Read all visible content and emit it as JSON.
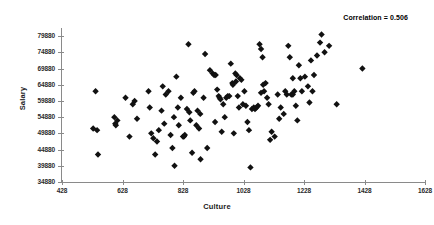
{
  "chart_data": {
    "type": "scatter",
    "title": "",
    "xlabel": "Culture",
    "ylabel": "Salary",
    "xlim": [
      428,
      1628
    ],
    "ylim": [
      34880,
      82380
    ],
    "xticks": [
      428,
      628,
      828,
      1028,
      1228,
      1428,
      1628
    ],
    "yticks": [
      34880,
      39880,
      44880,
      49880,
      54880,
      59880,
      64880,
      69880,
      74880,
      79880
    ],
    "xtick_labels": [
      "428",
      "628",
      "828",
      "1028",
      "1228",
      "1428",
      "1628"
    ],
    "ytick_labels": [
      "34880",
      "39880",
      "44880",
      "49880",
      "54880",
      "59880",
      "64880",
      "69880",
      "74880",
      "79880"
    ],
    "grid": false,
    "legend": false,
    "marker": "diamond",
    "marker_color": "#111111",
    "marker_size": 3.2,
    "axis_color": "#8a8a8a",
    "background_color": "#ffffff",
    "annotations": [
      {
        "name": "correlation",
        "text": "Correlation = 0.506",
        "value": 0.506,
        "position": "top-right"
      }
    ],
    "series": [
      {
        "name": "Culture vs Salary",
        "points": [
          [
            531,
            51380
          ],
          [
            539,
            62880
          ],
          [
            544,
            50880
          ],
          [
            547,
            43380
          ],
          [
            601,
            54880
          ],
          [
            604,
            52880
          ],
          [
            606,
            52380
          ],
          [
            611,
            53880
          ],
          [
            638,
            60880
          ],
          [
            651,
            48880
          ],
          [
            662,
            58880
          ],
          [
            668,
            59880
          ],
          [
            676,
            54380
          ],
          [
            714,
            62880
          ],
          [
            718,
            57880
          ],
          [
            723,
            49880
          ],
          [
            730,
            48380
          ],
          [
            736,
            43380
          ],
          [
            742,
            47380
          ],
          [
            748,
            50880
          ],
          [
            757,
            56880
          ],
          [
            761,
            64380
          ],
          [
            766,
            52880
          ],
          [
            771,
            61880
          ],
          [
            780,
            62880
          ],
          [
            787,
            49380
          ],
          [
            793,
            45380
          ],
          [
            798,
            54880
          ],
          [
            800,
            39880
          ],
          [
            806,
            67380
          ],
          [
            811,
            57880
          ],
          [
            814,
            52380
          ],
          [
            821,
            60880
          ],
          [
            828,
            48880
          ],
          [
            831,
            48880
          ],
          [
            834,
            49380
          ],
          [
            841,
            57380
          ],
          [
            846,
            77380
          ],
          [
            849,
            56380
          ],
          [
            852,
            53880
          ],
          [
            858,
            43880
          ],
          [
            862,
            62380
          ],
          [
            866,
            62880
          ],
          [
            872,
            52380
          ],
          [
            876,
            56880
          ],
          [
            881,
            51380
          ],
          [
            886,
            41880
          ],
          [
            896,
            60880
          ],
          [
            901,
            74380
          ],
          [
            908,
            45380
          ],
          [
            917,
            69380
          ],
          [
            926,
            68380
          ],
          [
            931,
            67880
          ],
          [
            936,
            67880
          ],
          [
            941,
            63380
          ],
          [
            946,
            61380
          ],
          [
            949,
            60880
          ],
          [
            952,
            60380
          ],
          [
            956,
            50380
          ],
          [
            961,
            58880
          ],
          [
            966,
            54880
          ],
          [
            971,
            60880
          ],
          [
            976,
            61380
          ],
          [
            981,
            61380
          ],
          [
            986,
            71380
          ],
          [
            991,
            65380
          ],
          [
            993,
            64880
          ],
          [
            996,
            49880
          ],
          [
            1001,
            68380
          ],
          [
            1005,
            67880
          ],
          [
            1009,
            61380
          ],
          [
            1013,
            57880
          ],
          [
            1016,
            66880
          ],
          [
            1021,
            66380
          ],
          [
            1026,
            58880
          ],
          [
            1031,
            62880
          ],
          [
            1036,
            58380
          ],
          [
            1041,
            53380
          ],
          [
            1046,
            50880
          ],
          [
            1051,
            39380
          ],
          [
            1056,
            57380
          ],
          [
            1062,
            57880
          ],
          [
            1066,
            57380
          ],
          [
            1071,
            57880
          ],
          [
            1076,
            58380
          ],
          [
            1081,
            77380
          ],
          [
            1086,
            75880
          ],
          [
            1091,
            73380
          ],
          [
            1096,
            62880
          ],
          [
            1101,
            65380
          ],
          [
            1106,
            60880
          ],
          [
            1111,
            58880
          ],
          [
            1116,
            47880
          ],
          [
            1121,
            50380
          ],
          [
            1131,
            48880
          ],
          [
            1141,
            61880
          ],
          [
            1151,
            57880
          ],
          [
            1161,
            55880
          ],
          [
            1166,
            62880
          ],
          [
            1171,
            61880
          ],
          [
            1176,
            76880
          ],
          [
            1181,
            73380
          ],
          [
            1186,
            61880
          ],
          [
            1191,
            61880
          ],
          [
            1196,
            62880
          ],
          [
            1201,
            58380
          ],
          [
            1206,
            53880
          ],
          [
            1211,
            70880
          ],
          [
            1216,
            66880
          ],
          [
            1221,
            62880
          ],
          [
            1231,
            67380
          ],
          [
            1241,
            64380
          ],
          [
            1246,
            59380
          ],
          [
            1251,
            72380
          ],
          [
            1256,
            62880
          ],
          [
            1261,
            67880
          ],
          [
            1271,
            73880
          ],
          [
            1281,
            77880
          ],
          [
            1286,
            80380
          ],
          [
            1296,
            74880
          ],
          [
            1311,
            76880
          ],
          [
            1336,
            58880
          ],
          [
            1421,
            69880
          ],
          [
            1086,
            62380
          ],
          [
            885,
            55880
          ],
          [
            1003,
            65880
          ],
          [
            1093,
            64880
          ],
          [
            1146,
            54380
          ],
          [
            1191,
            66880
          ],
          [
            934,
            53380
          ]
        ]
      }
    ]
  }
}
